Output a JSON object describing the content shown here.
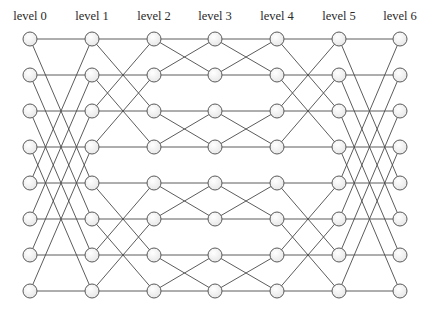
{
  "diagram": {
    "type": "benes-network",
    "levels": [
      {
        "label": "level 0",
        "x": 30
      },
      {
        "label": "level 1",
        "x": 92
      },
      {
        "label": "level 2",
        "x": 154
      },
      {
        "label": "level 3",
        "x": 215
      },
      {
        "label": "level 4",
        "x": 277
      },
      {
        "label": "level 5",
        "x": 339
      },
      {
        "label": "level 6",
        "x": 400
      }
    ],
    "rows_y": [
      39,
      75,
      111,
      147,
      183,
      219,
      255,
      291
    ],
    "node_radius": 7,
    "strides": [
      4,
      2,
      1,
      1,
      2,
      4
    ],
    "colors": {
      "edge": "#4a4a4a",
      "node_stroke": "#5a5a5a",
      "node_fill_light": "#ffffff",
      "node_fill_dark": "#e6e6e6",
      "label": "#2a2a2a"
    }
  }
}
